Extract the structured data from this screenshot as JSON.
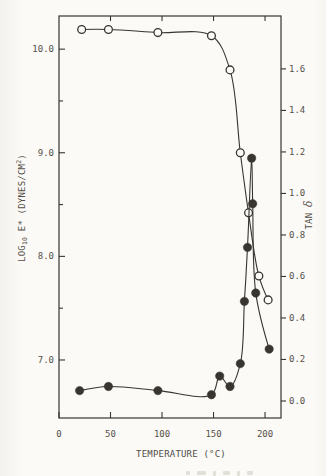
{
  "ink_color": "#38342f",
  "text_color": "#55504a",
  "background_color": "#fbfaf7",
  "chart_data": {
    "type": "line",
    "title": "",
    "xlabel": "TEMPERATURE (°C)",
    "ylabel_left": "LOG10 E* (DYNES/CM2)",
    "ylabel_right": "TAN δ",
    "left_label": {
      "pre": "LOG",
      "sub": "10",
      "mid": " E* (DYNES/CM",
      "sup": "2",
      "post": ")"
    },
    "right_label": {
      "pre": "TAN ",
      "delta": "δ"
    },
    "grid": false,
    "frame": true,
    "legend": "none (series distinguished by open vs filled circle markers)",
    "x_axis": {
      "min": 0,
      "max": 215.5,
      "ticks": [
        0,
        50,
        100,
        150,
        200
      ],
      "tick_labels": [
        "0",
        "50",
        "100",
        "150",
        "200"
      ],
      "top_ticks": [
        50,
        100,
        150,
        200
      ]
    },
    "y_left": {
      "min": 6.44,
      "max": 10.32,
      "major_ticks": [
        10.0,
        9.0,
        8.0,
        7.0
      ],
      "tick_labels": [
        "10.0",
        "9.0",
        "8.0",
        "7.0"
      ],
      "minor_ticks": [
        9.5,
        8.5,
        7.5
      ]
    },
    "y_right": {
      "min": -0.082,
      "max": 1.855,
      "ticks": [
        1.6,
        1.4,
        1.2,
        1.0,
        0.8,
        0.6,
        0.4,
        0.2,
        0.0
      ],
      "tick_labels": [
        "1.6",
        "1.4",
        "1.2",
        "1.0",
        "0.8",
        "0.6",
        "0.4",
        "0.2",
        "0.0"
      ]
    },
    "series": [
      {
        "name": "LOG10 E* (DYNES/CM2)",
        "axis": "left",
        "marker": "open-circle",
        "points": [
          [
            22,
            10.19
          ],
          [
            48,
            10.19
          ],
          [
            96,
            10.16
          ],
          [
            148,
            10.13
          ],
          [
            166,
            9.8
          ],
          [
            176,
            9.0
          ],
          [
            184,
            8.42
          ],
          [
            194,
            7.81
          ],
          [
            203,
            7.58
          ]
        ]
      },
      {
        "name": "TAN δ",
        "axis": "right",
        "marker": "filled-circle",
        "points": [
          [
            20,
            0.05
          ],
          [
            48,
            0.07
          ],
          [
            96,
            0.05
          ],
          [
            148,
            0.03
          ],
          [
            156,
            0.12
          ],
          [
            166,
            0.07
          ],
          [
            176,
            0.18
          ],
          [
            180,
            0.48
          ],
          [
            183,
            0.74
          ],
          [
            187,
            1.17
          ],
          [
            188,
            0.95
          ],
          [
            191,
            0.52
          ],
          [
            204,
            0.25
          ]
        ]
      }
    ]
  }
}
